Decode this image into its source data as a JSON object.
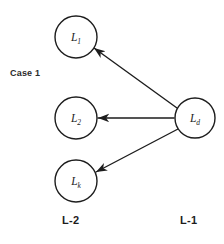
{
  "figure": {
    "case_label": "Case 1",
    "background_color": "#ffffff",
    "stroke_color": "#1d1d1d"
  },
  "nodes": {
    "source": {
      "id": "L_d",
      "letter": "L",
      "subscript": "d",
      "cx": 195,
      "cy": 118,
      "r": 20
    },
    "targets": [
      {
        "id": "L_1",
        "letter": "L",
        "subscript": "1",
        "cx": 76,
        "cy": 37,
        "r": 21
      },
      {
        "id": "L_2",
        "letter": "L",
        "subscript": "2",
        "cx": 76,
        "cy": 118,
        "r": 21
      },
      {
        "id": "L_k",
        "letter": "L",
        "subscript": "k",
        "cx": 76,
        "cy": 181,
        "r": 21
      }
    ]
  },
  "edges": [
    {
      "from": "L_d",
      "to": "L_1",
      "x1": 177,
      "y1": 108,
      "x2": 94,
      "y2": 48
    },
    {
      "from": "L_d",
      "to": "L_2",
      "x1": 174,
      "y1": 118,
      "x2": 98,
      "y2": 118
    },
    {
      "from": "L_d",
      "to": "L_k",
      "x1": 178,
      "y1": 129,
      "x2": 96,
      "y2": 172
    }
  ],
  "axis_labels": {
    "left": "L-2",
    "right": "L-1"
  }
}
